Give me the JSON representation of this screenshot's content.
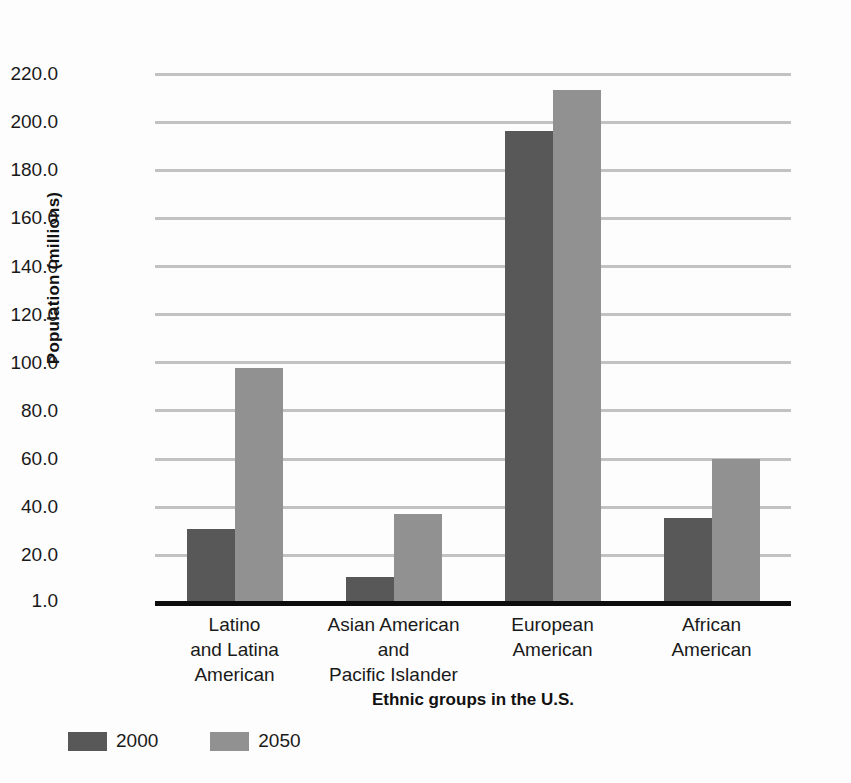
{
  "chart_data": {
    "type": "bar",
    "title": "",
    "xlabel": "Ethnic groups in the U.S.",
    "ylabel": "Population (millions)",
    "categories": [
      "Latino\nand Latina\nAmerican",
      "Asian American\nand\nPacific Islander",
      "European\nAmerican",
      "African\nAmerican"
    ],
    "series": [
      {
        "name": "2000",
        "color": "#585858",
        "values": [
          31.0,
          11.0,
          196.5,
          35.5
        ]
      },
      {
        "name": "2050",
        "color": "#919191",
        "values": [
          98.0,
          37.0,
          213.5,
          60.0
        ]
      }
    ],
    "ylim": [
      1.0,
      230.0
    ],
    "yticks": [
      220.0,
      200.0,
      180.0,
      160.0,
      140.0,
      120.0,
      100.0,
      80.0,
      60.0,
      40.0,
      20.0,
      1.0
    ],
    "ytick_labels": [
      "220.0",
      "200.0",
      "180.0",
      "160.0",
      "140.0",
      "120.0",
      "100.0",
      "80.0",
      "60.0",
      "40.0",
      "20.0",
      "1.0"
    ],
    "grid": true,
    "legend_position": "bottom-left",
    "legend_entries": [
      {
        "label": "2000",
        "color": "#585858"
      },
      {
        "label": "2050",
        "color": "#919191"
      }
    ]
  }
}
